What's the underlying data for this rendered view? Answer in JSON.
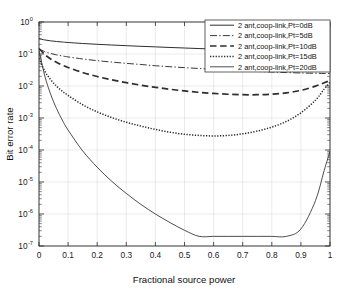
{
  "chart_data": {
    "type": "line",
    "title": "",
    "xlabel": "Fractional source power",
    "ylabel": "Bit error rate",
    "xlim": [
      0,
      1
    ],
    "ylim": [
      1e-07,
      1
    ],
    "yscale": "log",
    "grid": true,
    "legend_position": "top-right",
    "xticks": [
      "0",
      "0.1",
      "0.2",
      "0.3",
      "0.4",
      "0.5",
      "0.6",
      "0.7",
      "0.8",
      "0.9",
      "1"
    ],
    "xtick_values": [
      0,
      0.1,
      0.2,
      0.3,
      0.4,
      0.5,
      0.6,
      0.7,
      0.8,
      0.9,
      1
    ],
    "yticks": [
      "10^0",
      "10^-1",
      "10^-2",
      "10^-3",
      "10^-4",
      "10^-5",
      "10^-6",
      "10^-7"
    ],
    "ytick_values": [
      1,
      0.1,
      0.01,
      0.001,
      0.0001,
      1e-05,
      1e-06,
      1e-07
    ],
    "ytick_mantissa": "10",
    "ytick_exponents": [
      "0",
      "-1",
      "-2",
      "-3",
      "-4",
      "-5",
      "-6",
      "-7"
    ],
    "x": [
      0,
      0.02,
      0.04,
      0.06,
      0.08,
      0.1,
      0.15,
      0.2,
      0.25,
      0.3,
      0.35,
      0.4,
      0.45,
      0.5,
      0.55,
      0.6,
      0.65,
      0.7,
      0.75,
      0.8,
      0.85,
      0.9,
      0.95,
      0.98,
      1
    ],
    "series": [
      {
        "name": "2 ant,coop-link,Pt=0dB",
        "style": "solid",
        "values": [
          0.3,
          0.275,
          0.258,
          0.246,
          0.237,
          0.229,
          0.213,
          0.201,
          0.191,
          0.182,
          0.174,
          0.167,
          0.16,
          0.154,
          0.148,
          0.143,
          0.138,
          0.134,
          0.13,
          0.127,
          0.124,
          0.122,
          0.121,
          0.121,
          0.121
        ]
      },
      {
        "name": "2 ant,coop-link,Pt=5dB",
        "style": "dash-dot",
        "values": [
          0.145,
          0.118,
          0.104,
          0.094,
          0.087,
          0.081,
          0.07,
          0.062,
          0.056,
          0.051,
          0.047,
          0.043,
          0.04,
          0.0375,
          0.0352,
          0.0332,
          0.0314,
          0.0299,
          0.0285,
          0.0273,
          0.0263,
          0.0255,
          0.0249,
          0.0246,
          0.0245
        ]
      },
      {
        "name": "2 ant,coop-link,Pt=10dB",
        "style": "dashed",
        "values": [
          0.148,
          0.096,
          0.07,
          0.055,
          0.0452,
          0.038,
          0.0264,
          0.0198,
          0.0156,
          0.0127,
          0.0106,
          0.0091,
          0.0079,
          0.007,
          0.00634,
          0.00585,
          0.00552,
          0.00534,
          0.00534,
          0.00556,
          0.0061,
          0.0073,
          0.0099,
          0.0126,
          0.0148
        ]
      },
      {
        "name": "2 ant,coop-link,Pt=15dB",
        "style": "dotted",
        "values": [
          0.072,
          0.029,
          0.0158,
          0.01,
          0.0069,
          0.00506,
          0.00259,
          0.00155,
          0.00103,
          0.00074,
          0.00056,
          0.00044,
          0.00036,
          0.00031,
          0.000285,
          0.000275,
          0.000285,
          0.00032,
          0.00039,
          0.00052,
          0.00078,
          0.00145,
          0.0036,
          0.008,
          0.013
        ]
      },
      {
        "name": "2 ant,coop-link,Pt=20dB",
        "style": "solid-thin",
        "values": [
          0.13,
          0.0205,
          0.00555,
          0.002,
          0.00086,
          0.00042,
          9.4e-05,
          2.9e-05,
          1.05e-05,
          4.4e-06,
          2e-06,
          1e-06,
          5.4e-07,
          3.1e-07,
          2e-07,
          2e-07,
          2e-07,
          2e-07,
          2e-07,
          2e-07,
          2e-07,
          3.4e-07,
          2.6e-06,
          2.3e-05,
          9e-05
        ]
      }
    ],
    "legend_entries": [
      "2 ant,coop-link,Pt=0dB",
      "2 ant,coop-link,Pt=5dB",
      "2 ant,coop-link,Pt=10dB",
      "2 ant,coop-link,Pt=15dB",
      "2 ant,coop-link,Pt=20dB"
    ]
  }
}
